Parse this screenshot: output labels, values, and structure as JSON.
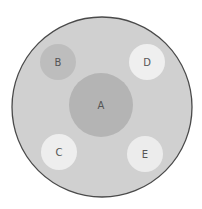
{
  "diagram": {
    "dish": {
      "cx": 102,
      "cy": 107,
      "r": 90,
      "fill": "#d0d0d0",
      "stroke": "#4a4a4a"
    },
    "zones": [
      {
        "label": "A",
        "cx": 101,
        "cy": 105,
        "r": 32,
        "fill": "#b4b4b4"
      },
      {
        "label": "B",
        "cx": 58,
        "cy": 62,
        "r": 18,
        "fill": "#bdbdbd"
      },
      {
        "label": "D",
        "cx": 147,
        "cy": 62,
        "r": 18,
        "fill": "#efefef"
      },
      {
        "label": "C",
        "cx": 59,
        "cy": 152,
        "r": 18,
        "fill": "#eeeeee"
      },
      {
        "label": "E",
        "cx": 145,
        "cy": 154,
        "r": 18,
        "fill": "#ececec"
      }
    ]
  }
}
